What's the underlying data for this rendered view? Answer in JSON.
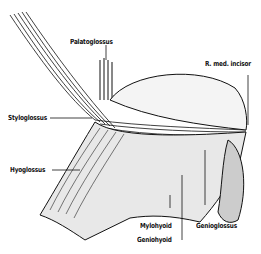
{
  "figure": {
    "labels": [
      {
        "id": "palatoglossus",
        "text": "Palatoglossus"
      },
      {
        "id": "r-med-incisor",
        "text": "R. med. incisor"
      },
      {
        "id": "styloglossus",
        "text": "Styloglossus"
      },
      {
        "id": "hyoglossus",
        "text": "Hyoglossus"
      },
      {
        "id": "mylohyoid",
        "text": "Mylohyoid"
      },
      {
        "id": "geniohyoid",
        "text": "Geniohyoid"
      },
      {
        "id": "genioglossus",
        "text": "Genioglossus"
      }
    ]
  }
}
